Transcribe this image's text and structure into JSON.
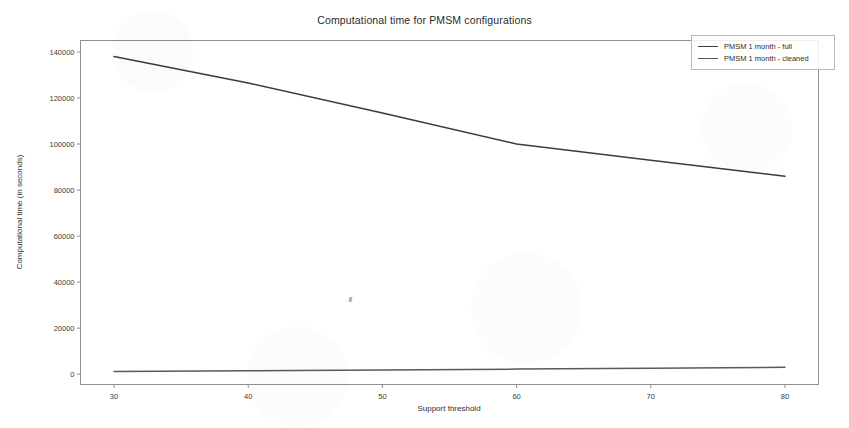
{
  "chart_data": {
    "type": "line",
    "title": "Computational time for PMSM configurations",
    "xlabel": "Support threshold",
    "ylabel": "Computational time (in seconds)",
    "x": [
      30,
      40,
      50,
      60,
      70,
      80
    ],
    "xlim": [
      27.5,
      82.5
    ],
    "ylim": [
      -4500,
      145000
    ],
    "xticks": [
      30,
      40,
      50,
      60,
      70,
      80
    ],
    "xticklabels": [
      "30",
      "40",
      "50",
      "60",
      "70",
      "80"
    ],
    "yticks": [
      0,
      20000,
      40000,
      60000,
      80000,
      100000,
      120000,
      140000
    ],
    "yticklabels": [
      "0",
      "20000",
      "40000",
      "60000",
      "80000",
      "100000",
      "120000",
      "140000"
    ],
    "grid": false,
    "legend_position": "upper right",
    "series": [
      {
        "name": "PMSM 1 month - full",
        "color": "#3b3b3b",
        "values": [
          138000,
          126500,
          113500,
          100000,
          93000,
          86000
        ]
      },
      {
        "name": "PMSM 1 month - cleaned",
        "color": "#5a5a5a",
        "values": [
          1200,
          1500,
          1800,
          2200,
          2600,
          3000
        ]
      }
    ]
  },
  "legend": {
    "entries": [
      {
        "label": "PMSM 1 month - full",
        "color": "#3b3b3b"
      },
      {
        "label": "PMSM 1 month - cleaned",
        "color": "#5a5a5a"
      }
    ]
  }
}
